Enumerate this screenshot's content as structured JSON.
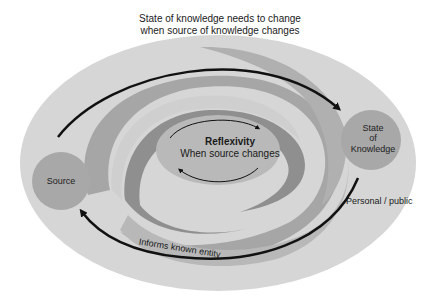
{
  "diagram": {
    "top_caption_line1": "State of knowledge needs to change",
    "top_caption_line2": "when source of knowledge changes",
    "center": {
      "title": "Reflexivity",
      "subtitle": "When source changes"
    },
    "nodes": {
      "source": "Source",
      "state_of_knowledge_line1": "State",
      "state_of_knowledge_line2": "of",
      "state_of_knowledge_line3": "Knowledge"
    },
    "edge_labels": {
      "personal_public": "Personal / public",
      "informs": "Informs known entity"
    },
    "colors": {
      "outer_ellipse": "#d6d6d6",
      "band_light": "#c4c4c4",
      "swirl_mid": "#9a9a9a",
      "swirl_dark": "#8c8c8c",
      "node_fill": "#a8a8a8",
      "center_fill": "#b9b9b9",
      "arrow": "#111111"
    }
  }
}
